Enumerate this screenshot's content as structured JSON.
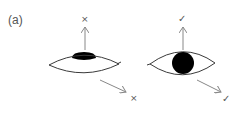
{
  "figure": {
    "panel_label": "(a)",
    "colors": {
      "stroke": "#3a3a3a",
      "arrow": "#888888",
      "pupil": "#000000",
      "marks": "#555555"
    },
    "left_eye": {
      "description": "eyelid drooping, pupil partly covered",
      "up_result": "×",
      "diagonal_result": "×"
    },
    "right_eye": {
      "description": "open eye, pupil fully visible",
      "up_result": "✓",
      "diagonal_result": "✓"
    }
  }
}
